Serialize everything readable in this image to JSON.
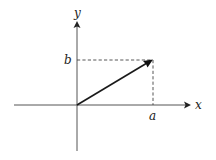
{
  "diagram": {
    "type": "vector-components",
    "axes": {
      "x_label": "x",
      "y_label": "y"
    },
    "vector": {
      "from": "origin",
      "to_x_label": "a",
      "to_y_label": "b"
    },
    "labels": {
      "x_axis": "x",
      "y_axis": "y",
      "x_component": "a",
      "y_component": "b"
    },
    "colors": {
      "axis": "#555555",
      "vector": "#1a1a1a",
      "dashed": "#444444",
      "background": "#ffffff"
    }
  }
}
